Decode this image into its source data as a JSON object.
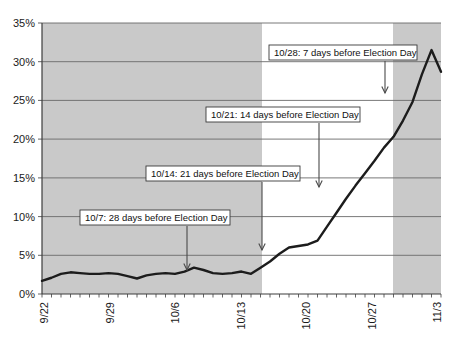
{
  "chart_data": {
    "type": "line",
    "title": "",
    "subtitle": "",
    "xlabel": "",
    "ylabel": "",
    "ylim": [
      0,
      35
    ],
    "ytick_labels": [
      "0%",
      "5%",
      "10%",
      "15%",
      "20%",
      "25%",
      "30%",
      "35%"
    ],
    "ytick_values": [
      0,
      5,
      10,
      15,
      20,
      25,
      30,
      35
    ],
    "xtick_labels": [
      "9/22",
      "9/29",
      "10/6",
      "10/13",
      "10/20",
      "10/27",
      "11/3"
    ],
    "xtick_values": [
      "9/22",
      "9/29",
      "10/6",
      "10/13",
      "10/20",
      "10/27",
      "11/3"
    ],
    "grid": true,
    "legend": "none",
    "x": [
      "9/22",
      "9/23",
      "9/24",
      "9/25",
      "9/26",
      "9/27",
      "9/28",
      "9/29",
      "9/30",
      "10/1",
      "10/2",
      "10/3",
      "10/4",
      "10/5",
      "10/6",
      "10/7",
      "10/8",
      "10/9",
      "10/10",
      "10/11",
      "10/12",
      "10/13",
      "10/14",
      "10/15",
      "10/16",
      "10/17",
      "10/18",
      "10/19",
      "10/20",
      "10/21",
      "10/22",
      "10/23",
      "10/24",
      "10/25",
      "10/26",
      "10/27",
      "10/28",
      "10/29",
      "10/30",
      "10/31",
      "11/1",
      "11/2",
      "11/3"
    ],
    "values": [
      1.7,
      2.1,
      2.6,
      2.8,
      2.7,
      2.6,
      2.6,
      2.7,
      2.6,
      2.3,
      2.0,
      2.4,
      2.6,
      2.7,
      2.6,
      2.9,
      3.4,
      3.1,
      2.7,
      2.6,
      2.7,
      2.9,
      2.6,
      3.4,
      4.2,
      5.2,
      6.0,
      6.2,
      6.4,
      6.9,
      8.7,
      10.5,
      12.3,
      14.0,
      15.6,
      17.2,
      18.9,
      20.3,
      22.4,
      24.8,
      28.4,
      31.5,
      28.7
    ],
    "shaded_bands": [
      {
        "from": "9/22",
        "to": "10/14",
        "color": "#c9c9c9"
      },
      {
        "from": "10/28",
        "to": "11/3",
        "color": "#c9c9c9"
      }
    ],
    "annotations": [
      {
        "id": "annot-10-28",
        "label": "10/28: 7 days before Election Day",
        "target_x": "10/28",
        "target_y": 20.0
      },
      {
        "id": "annot-10-21",
        "label": "10/21: 14 days before Election Day",
        "target_x": "10/21",
        "target_y": 7.5
      },
      {
        "id": "annot-10-14",
        "label": "10/14: 21 days before Election Day",
        "target_x": "10/14",
        "target_y": 3.4
      },
      {
        "id": "annot-10-07",
        "label": "10/7: 28 days before Election Day",
        "target_x": "10/7",
        "target_y": 3.5
      }
    ]
  },
  "colors": {
    "band": "#c9c9c9",
    "line": "#1c1c1c",
    "grid": "#6a6a6a",
    "axis": "#3d3d3d",
    "plot_background": "#ffffff",
    "annotation_box": "#ffffff"
  },
  "footer": {
    "caption": ""
  }
}
